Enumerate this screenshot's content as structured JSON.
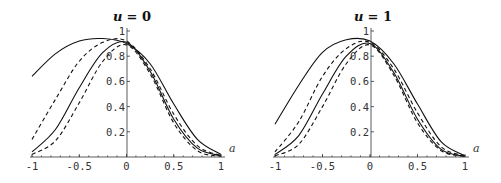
{
  "chart_data": [
    {
      "type": "line",
      "title": "u = 0",
      "title_var": "u",
      "title_val": "= 0",
      "xlabel": "a",
      "ylabel": "",
      "xlim": [
        -1,
        1
      ],
      "ylim": [
        0,
        1
      ],
      "grid": false,
      "x_ticks": [
        "-1",
        "-0.5",
        "0",
        "0.5",
        "1"
      ],
      "y_ticks": [
        "0.2",
        "0.4",
        "0.6",
        "0.8",
        "1"
      ],
      "x": [
        -1,
        -0.75,
        -0.5,
        -0.25,
        0,
        0.25,
        0.5,
        0.75,
        1
      ],
      "series": [
        {
          "name": "solid-1",
          "style": "solid",
          "values": [
            0.64,
            0.82,
            0.92,
            0.94,
            0.9,
            0.74,
            0.42,
            0.14,
            0.02
          ]
        },
        {
          "name": "dashed-1",
          "style": "dashed",
          "values": [
            0.14,
            0.46,
            0.76,
            0.91,
            0.92,
            0.7,
            0.34,
            0.09,
            0.01
          ]
        },
        {
          "name": "solid-2",
          "style": "solid",
          "values": [
            0.04,
            0.22,
            0.55,
            0.83,
            0.91,
            0.68,
            0.3,
            0.07,
            0.01
          ]
        },
        {
          "name": "dashed-2",
          "style": "dashed",
          "values": [
            0.02,
            0.13,
            0.43,
            0.76,
            0.89,
            0.66,
            0.27,
            0.05,
            0.005
          ]
        }
      ]
    },
    {
      "type": "line",
      "title": "u = 1",
      "title_var": "u",
      "title_val": "= 1",
      "xlabel": "a",
      "ylabel": "",
      "xlim": [
        -1,
        1
      ],
      "ylim": [
        0,
        1
      ],
      "grid": false,
      "x_ticks": [
        "-1",
        "-0.5",
        "0",
        "0.5",
        "1"
      ],
      "y_ticks": [
        "0.2",
        "0.4",
        "0.6",
        "0.8",
        "1"
      ],
      "x": [
        -1,
        -0.75,
        -0.5,
        -0.25,
        0,
        0.25,
        0.5,
        0.75,
        1
      ],
      "series": [
        {
          "name": "solid-1",
          "style": "solid",
          "values": [
            0.26,
            0.57,
            0.83,
            0.93,
            0.92,
            0.74,
            0.42,
            0.12,
            0.01
          ]
        },
        {
          "name": "dashed-1",
          "style": "dashed",
          "values": [
            0.04,
            0.28,
            0.64,
            0.86,
            0.91,
            0.7,
            0.35,
            0.08,
            0.01
          ]
        },
        {
          "name": "solid-2",
          "style": "solid",
          "values": [
            0.02,
            0.17,
            0.5,
            0.8,
            0.9,
            0.67,
            0.3,
            0.06,
            0.005
          ]
        },
        {
          "name": "dashed-2",
          "style": "dashed",
          "values": [
            0.01,
            0.1,
            0.4,
            0.74,
            0.89,
            0.65,
            0.27,
            0.05,
            0.005
          ]
        }
      ]
    }
  ]
}
